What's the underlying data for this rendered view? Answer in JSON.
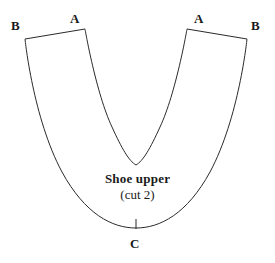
{
  "figure": {
    "title": "Shoe upper",
    "subtitle": "(cut 2)",
    "background_color": "#ffffff",
    "line_color": "#2a2a2a",
    "line_width": 1,
    "width": 275,
    "height": 263
  },
  "labels": {
    "b_left": "B",
    "a_left": "A",
    "a_right": "A",
    "b_right": "B",
    "c_bottom": "C"
  },
  "shape": {
    "name": "shoe-upper-pattern-outline",
    "description": "U-shaped shoe upper sewing pattern with a V notch between the two A points",
    "points": {
      "a_left": [
        85,
        29
      ],
      "b_left": [
        25,
        39
      ],
      "a_right": [
        187,
        29
      ],
      "b_right": [
        247,
        39
      ],
      "v_notch_bottom": [
        136,
        165
      ],
      "outer_bottom": [
        136,
        228
      ]
    },
    "outline_path": "M 85 29 L 25 39 C 25 39 33 118 62 172 C 85 214 112 228 136 228 C 160 228 187 214 210 172 C 239 118 247 39 247 39 L 187 29 C 187 29 176 93 160 127 C 150 149 143 161 136 165 C 129 161 122 149 112 127 C 96 93 85 29 85 29 Z"
  },
  "notation": {
    "c_tick_mark": {
      "name": "center-tick-mark",
      "x": 136,
      "y_top": 219,
      "y_bottom": 229
    }
  }
}
